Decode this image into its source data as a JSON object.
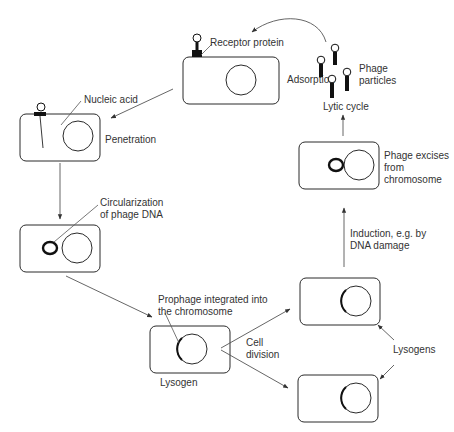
{
  "diagram": {
    "stages": {
      "adsorption": "Adsorption",
      "penetration": "Penetration",
      "lytic_cycle": "Lytic cycle",
      "phage_excises_1": "Phage excises",
      "phage_excises_2": "from",
      "phage_excises_3": "chromosome",
      "induction_1": "Induction, e.g. by",
      "induction_2": "DNA damage",
      "lysogen": "Lysogen",
      "cell_division_1": "Cell",
      "cell_division_2": "division",
      "lysogens": "Lysogens"
    },
    "annotations": {
      "receptor_protein": "Receptor protein",
      "nucleic_acid": "Nucleic acid",
      "circularization_1": "Circularization",
      "circularization_2": "of phage DNA",
      "prophage_1": "Prophage integrated into",
      "prophage_2": "the chromosome",
      "phage_particles_1": "Phage",
      "phage_particles_2": "particles"
    }
  }
}
